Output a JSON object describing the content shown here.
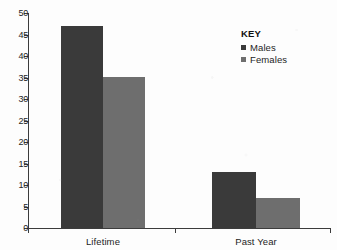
{
  "chart_data": {
    "type": "bar",
    "title": "",
    "subtitle": "",
    "xlabel": "",
    "ylabel": "",
    "categories": [
      "Lifetime",
      "Past Year"
    ],
    "series": [
      {
        "name": "Males",
        "color": "#3a3a3a",
        "values": [
          47,
          13
        ]
      },
      {
        "name": "Females",
        "color": "#6e6e6e",
        "values": [
          35,
          7
        ]
      }
    ],
    "ylim": [
      0,
      50
    ],
    "ytick_labels": [
      "0",
      "5",
      "10",
      "15",
      "20",
      "25",
      "30",
      "35",
      "40",
      "45",
      "50"
    ],
    "ytick_values": [
      0,
      5,
      10,
      15,
      20,
      25,
      30,
      35,
      40,
      45,
      50
    ],
    "grid": false,
    "legend_position": "top-right",
    "legend_title": "KEY",
    "background_color": "#fdfdfd",
    "axis_color": "#3c3c3c"
  },
  "legend": {
    "title": "KEY",
    "entries": [
      {
        "label": "Males"
      },
      {
        "label": "Females"
      }
    ]
  },
  "axes": {
    "y_ticks": [
      {
        "label": "50"
      },
      {
        "label": "45"
      },
      {
        "label": "40"
      },
      {
        "label": "35"
      },
      {
        "label": "30"
      },
      {
        "label": "25"
      },
      {
        "label": "20"
      },
      {
        "label": "15"
      },
      {
        "label": "10"
      },
      {
        "label": "5"
      },
      {
        "label": "0"
      }
    ],
    "x_categories": [
      {
        "label": "Lifetime"
      },
      {
        "label": "Past Year"
      }
    ]
  }
}
